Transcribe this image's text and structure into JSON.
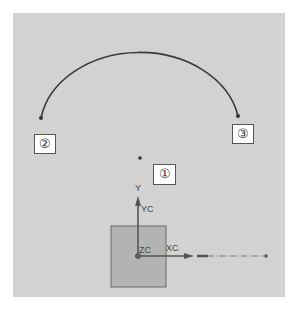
{
  "viewport": {
    "background": "#d2d2d2"
  },
  "labels": {
    "point1": "①",
    "point2": "②",
    "point3": "③"
  },
  "axes": {
    "yc_label": "YC",
    "xc_label": "XC",
    "zc_label": "ZC",
    "y_tip": "Y",
    "x_tip": "X"
  },
  "colors": {
    "arc": "#3a3a3a",
    "square_fill": "#b3b3b3",
    "square_border": "#6a6a6a",
    "axis": "#555555"
  }
}
